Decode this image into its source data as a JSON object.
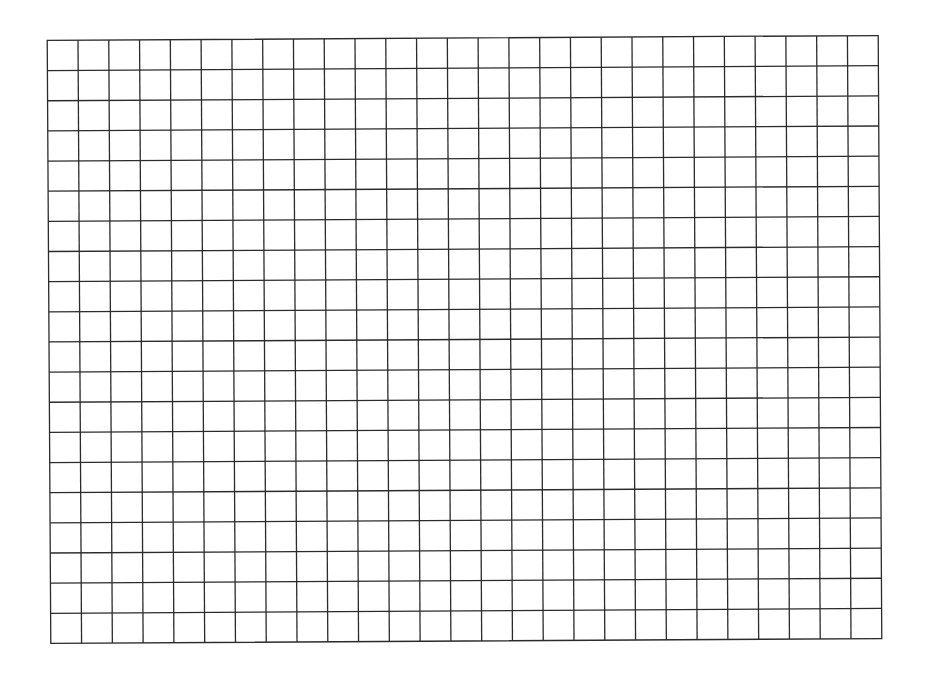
{
  "grid": {
    "columns": 27,
    "rows": 20,
    "origin": {
      "x": 49,
      "y": 38
    },
    "width": 831,
    "height": 603,
    "rotation_deg": -0.34,
    "line_color": "#2b2b2b",
    "line_width": 1.3,
    "background": "#ffffff"
  }
}
